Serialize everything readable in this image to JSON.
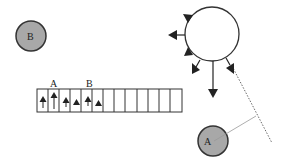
{
  "diagram": {
    "colors": {
      "ball_fill": "#a8a8a8",
      "stroke": "#222222",
      "background": "#ffffff"
    },
    "balls": [
      {
        "label": "B",
        "cx": 31,
        "cy": 36,
        "r": 15
      },
      {
        "label": "A",
        "cx": 213,
        "cy": 141,
        "r": 15
      }
    ],
    "strip": {
      "labels": [
        {
          "text": "A",
          "x": 54,
          "y": 88
        },
        {
          "text": "B",
          "x": 90,
          "y": 88
        }
      ],
      "cell_count": 13
    },
    "big_circle": {
      "cx": 212,
      "cy": 34,
      "r": 27
    }
  }
}
